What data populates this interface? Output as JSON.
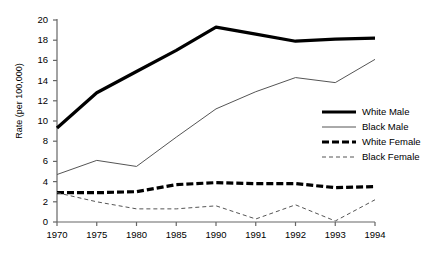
{
  "chart_data": {
    "type": "line",
    "title": "",
    "xlabel": "",
    "ylabel": "Rate (per 100,000)",
    "x": [
      "1970",
      "1975",
      "1980",
      "1985",
      "1990",
      "1991",
      "1992",
      "1993",
      "1994"
    ],
    "categories": [
      "1970",
      "1975",
      "1980",
      "1985",
      "1990",
      "1991",
      "1992",
      "1993",
      "1994"
    ],
    "ylim": [
      0,
      20
    ],
    "xlim": [
      0,
      8
    ],
    "yticks": [
      "0",
      "2",
      "4",
      "6",
      "8",
      "10",
      "12",
      "14",
      "16",
      "18",
      "20"
    ],
    "ytick_values": [
      0,
      2,
      4,
      6,
      8,
      10,
      12,
      14,
      16,
      18,
      20
    ],
    "grid": false,
    "legend_position": "right",
    "series": [
      {
        "name": "White Male",
        "style": "thick-solid",
        "color": "#000000",
        "values": [
          9.3,
          12.8,
          14.9,
          17.0,
          19.3,
          18.6,
          17.9,
          18.1,
          18.2
        ]
      },
      {
        "name": "Black Male",
        "style": "thin-solid",
        "color": "#555555",
        "values": [
          4.7,
          6.1,
          5.5,
          8.4,
          11.2,
          12.9,
          14.3,
          13.8,
          16.1
        ]
      },
      {
        "name": "White Female",
        "style": "thick-dashed",
        "color": "#000000",
        "values": [
          2.9,
          2.9,
          3.0,
          3.7,
          3.9,
          3.8,
          3.8,
          3.4,
          3.5
        ]
      },
      {
        "name": "Black Female",
        "style": "thin-dashed",
        "color": "#555555",
        "values": [
          2.9,
          2.0,
          1.3,
          1.3,
          1.6,
          0.3,
          1.7,
          0.1,
          2.2
        ]
      }
    ]
  },
  "axis": {
    "y_title": "Rate (per 100,000)"
  },
  "legend": {
    "items": [
      {
        "label": "White Male"
      },
      {
        "label": "Black Male"
      },
      {
        "label": "White Female"
      },
      {
        "label": "Black Female"
      }
    ]
  }
}
